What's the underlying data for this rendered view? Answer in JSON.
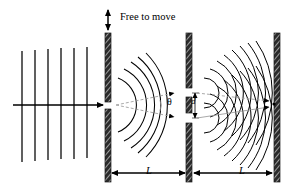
{
  "figure": {
    "background_color": "#ffffff",
    "stroke_color": "#000000",
    "ray_color": "#9a9a9a",
    "width": 292,
    "height": 195
  },
  "labels": {
    "free_to_move": "Free to move",
    "theta": "θ",
    "slit_separation": "d",
    "distance_1": "L",
    "distance_2": "L"
  },
  "elements": {
    "plane_wavefronts_count": 6,
    "incoming_ray_label": "incoming-plane-wave-arrow",
    "first_barrier_label": "single-slit-barrier",
    "second_barrier_label": "double-slit-barrier",
    "screen_label": "detection-screen",
    "middle_arcs_count": 5,
    "right_arcs_per_slit": 8,
    "slit_count_first_barrier": 1,
    "slit_count_second_barrier": 2,
    "diffraction_arrows": 2,
    "interference_arrows": 2
  },
  "geometry": {
    "barrier1_x": 108,
    "barrier2_x": 189,
    "screen_x": 277,
    "axis_y": 105,
    "barrier_top": 33,
    "barrier_bottom": 182,
    "slit1_y": 105,
    "slit2a_y": 93,
    "slit2b_y": 118
  }
}
